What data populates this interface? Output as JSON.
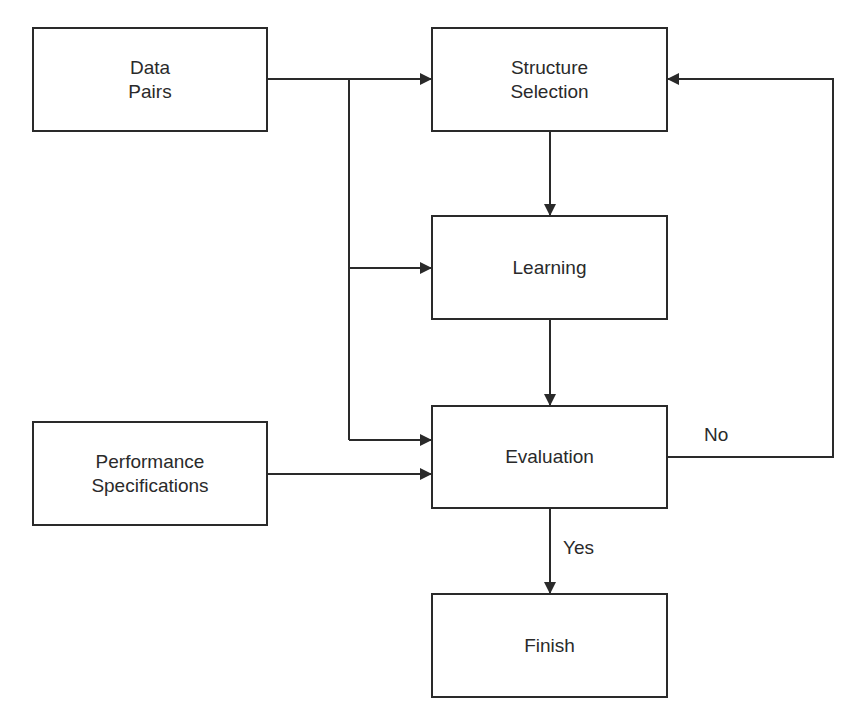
{
  "diagram": {
    "type": "flowchart",
    "nodes": [
      {
        "id": "data_pairs",
        "label": "Data\nPairs"
      },
      {
        "id": "structure_selection",
        "label": "Structure\nSelection"
      },
      {
        "id": "learning",
        "label": "Learning"
      },
      {
        "id": "evaluation",
        "label": "Evaluation"
      },
      {
        "id": "performance_specifications",
        "label": "Performance\nSpecifications"
      },
      {
        "id": "finish",
        "label": "Finish"
      }
    ],
    "edges": [
      {
        "from": "data_pairs",
        "to": "structure_selection",
        "label": ""
      },
      {
        "from": "data_pairs",
        "to": "learning",
        "label": ""
      },
      {
        "from": "data_pairs",
        "to": "evaluation",
        "label": ""
      },
      {
        "from": "structure_selection",
        "to": "learning",
        "label": ""
      },
      {
        "from": "learning",
        "to": "evaluation",
        "label": ""
      },
      {
        "from": "performance_specifications",
        "to": "evaluation",
        "label": ""
      },
      {
        "from": "evaluation",
        "to": "structure_selection",
        "label": "No"
      },
      {
        "from": "evaluation",
        "to": "finish",
        "label": "Yes"
      }
    ],
    "labels": {
      "no": "No",
      "yes": "Yes"
    },
    "colors": {
      "stroke": "#2a2a2a",
      "background": "#ffffff"
    }
  }
}
